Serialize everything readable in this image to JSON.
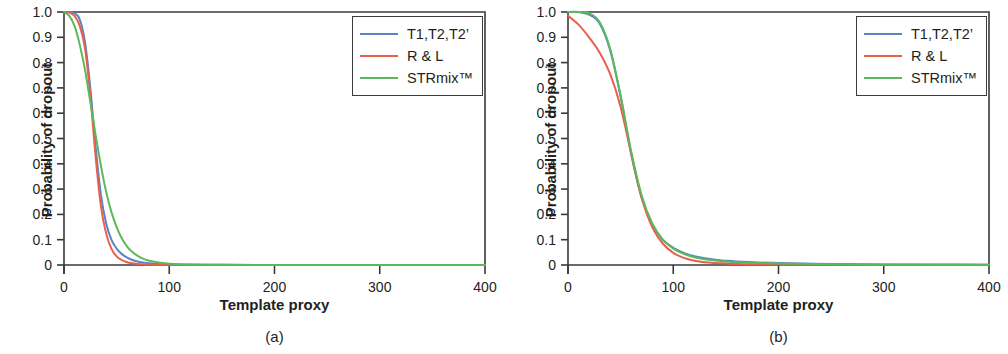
{
  "figure": {
    "panels": [
      {
        "id": "a",
        "caption": "(a)",
        "xlabel": "Template proxy",
        "ylabel": "Probability of dropout"
      },
      {
        "id": "b",
        "caption": "(b)",
        "xlabel": "Template proxy",
        "ylabel": "Probability of dropout"
      }
    ]
  },
  "axis": {
    "x_ticks": [
      "0",
      "100",
      "200",
      "300",
      "400"
    ],
    "y_ticks": [
      "1.0",
      "0.9",
      "0.8",
      "0.7",
      "0.6",
      "0.5",
      "0.4",
      "0.3",
      "0.2",
      "0.1",
      "0"
    ]
  },
  "legend": {
    "entries": [
      {
        "label": "T1,T2,T2’",
        "color": "#5b84c4"
      },
      {
        "label": "R & L",
        "color": "#e8604c"
      },
      {
        "label": "STRmix™",
        "color": "#5cb85c"
      }
    ]
  },
  "colors": {
    "blue": "#5b84c4",
    "red": "#e8604c",
    "green": "#5cb85c",
    "axis": "#3a3a3a",
    "text": "#231f20",
    "background": "#ffffff"
  },
  "chart_data": [
    {
      "type": "line",
      "title": "(a)",
      "xlabel": "Template proxy",
      "ylabel": "Probability of dropout",
      "xlim": [
        0,
        400
      ],
      "ylim": [
        0,
        1.0
      ],
      "xticks": [
        0,
        100,
        200,
        300,
        400
      ],
      "yticks": [
        0,
        0.1,
        0.2,
        0.3,
        0.4,
        0.5,
        0.6,
        0.7,
        0.8,
        0.9,
        1.0
      ],
      "grid": false,
      "legend_position": "upper right",
      "x": [
        0,
        5,
        10,
        15,
        20,
        25,
        30,
        35,
        40,
        45,
        50,
        55,
        60,
        65,
        70,
        75,
        80,
        90,
        100,
        125,
        150,
        200,
        250,
        300,
        350,
        400
      ],
      "series": [
        {
          "name": "T1,T2,T2’",
          "color": "#5b84c4",
          "values": [
            1.0,
            1.0,
            0.995,
            0.97,
            0.88,
            0.7,
            0.47,
            0.28,
            0.165,
            0.1,
            0.065,
            0.043,
            0.029,
            0.02,
            0.014,
            0.01,
            0.007,
            0.004,
            0.002,
            0.001,
            0.0005,
            0.0,
            0.0,
            0.0,
            0.0,
            0.0
          ]
        },
        {
          "name": "R & L",
          "color": "#e8604c",
          "values": [
            1.0,
            0.998,
            0.985,
            0.945,
            0.855,
            0.67,
            0.43,
            0.235,
            0.125,
            0.065,
            0.034,
            0.019,
            0.011,
            0.007,
            0.004,
            0.003,
            0.002,
            0.001,
            0.0005,
            0.0,
            0.0,
            0.0,
            0.0,
            0.0,
            0.0,
            0.0
          ]
        },
        {
          "name": "STRmix™",
          "color": "#5cb85c",
          "values": [
            1.0,
            0.985,
            0.945,
            0.87,
            0.77,
            0.645,
            0.515,
            0.395,
            0.29,
            0.21,
            0.15,
            0.105,
            0.073,
            0.051,
            0.036,
            0.025,
            0.018,
            0.01,
            0.005,
            0.002,
            0.001,
            0.0,
            0.0,
            0.0,
            0.0,
            0.0
          ]
        }
      ]
    },
    {
      "type": "line",
      "title": "(b)",
      "xlabel": "Template proxy",
      "ylabel": "Probability of dropout",
      "xlim": [
        0,
        400
      ],
      "ylim": [
        0,
        1.0
      ],
      "xticks": [
        0,
        100,
        200,
        300,
        400
      ],
      "yticks": [
        0,
        0.1,
        0.2,
        0.3,
        0.4,
        0.5,
        0.6,
        0.7,
        0.8,
        0.9,
        1.0
      ],
      "grid": false,
      "legend_position": "upper right",
      "x": [
        0,
        10,
        20,
        30,
        40,
        50,
        60,
        70,
        80,
        90,
        100,
        110,
        120,
        130,
        140,
        150,
        160,
        180,
        200,
        250,
        300,
        350,
        400
      ],
      "series": [
        {
          "name": "T1,T2,T2’",
          "color": "#5b84c4",
          "values": [
            1.0,
            1.0,
            0.99,
            0.955,
            0.85,
            0.665,
            0.44,
            0.265,
            0.16,
            0.1,
            0.068,
            0.048,
            0.035,
            0.027,
            0.021,
            0.017,
            0.014,
            0.01,
            0.008,
            0.004,
            0.002,
            0.002,
            0.001
          ]
        },
        {
          "name": "R & L",
          "color": "#e8604c",
          "values": [
            0.985,
            0.95,
            0.9,
            0.84,
            0.755,
            0.625,
            0.44,
            0.265,
            0.15,
            0.085,
            0.048,
            0.028,
            0.017,
            0.011,
            0.008,
            0.006,
            0.004,
            0.003,
            0.002,
            0.001,
            0.0,
            0.0,
            0.0
          ]
        },
        {
          "name": "STRmix™",
          "color": "#5cb85c",
          "values": [
            1.0,
            1.0,
            0.995,
            0.96,
            0.855,
            0.67,
            0.45,
            0.275,
            0.165,
            0.1,
            0.065,
            0.044,
            0.031,
            0.023,
            0.018,
            0.014,
            0.011,
            0.008,
            0.006,
            0.003,
            0.002,
            0.001,
            0.001
          ]
        }
      ]
    }
  ]
}
